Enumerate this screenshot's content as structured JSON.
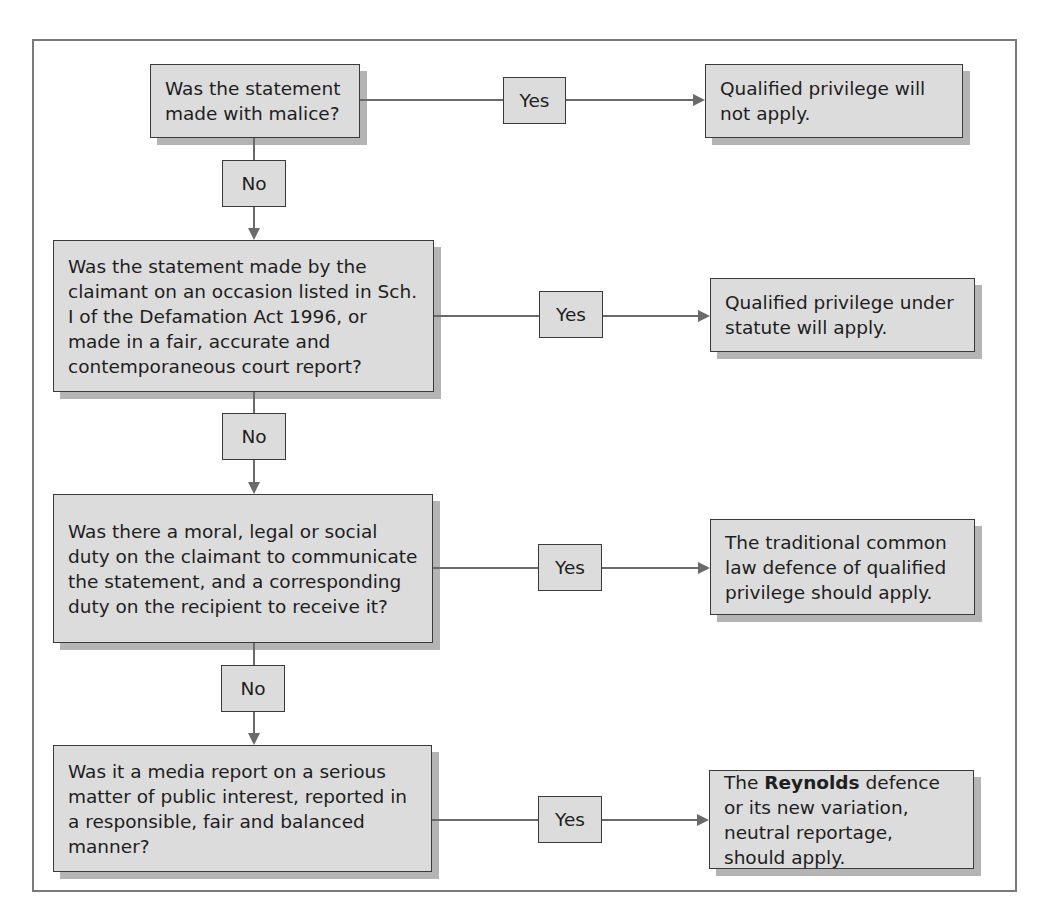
{
  "diagram": {
    "type": "flowchart",
    "questions": [
      {
        "id": "q1",
        "text": "Was the statement made with malice?"
      },
      {
        "id": "q2",
        "text": "Was the statement made by the claimant on an occasion listed in Sch. I of the Defamation Act 1996, or made in a fair, accurate and contemporaneous court report?"
      },
      {
        "id": "q3",
        "text": "Was there a moral, legal or social duty on the claimant to communicate the statement, and a corresponding duty on the recipient to receive it?"
      },
      {
        "id": "q4",
        "text": "Was it a media report on a serious matter of public interest, reported in a responsible, fair and balanced manner?"
      }
    ],
    "outcomes": [
      {
        "id": "o1",
        "text": "Qualified privilege will not apply."
      },
      {
        "id": "o2",
        "text": "Qualified privilege under statute will apply."
      },
      {
        "id": "o3",
        "text": "The traditional common law defence of qualified privilege should apply."
      },
      {
        "id": "o4",
        "prefix": "The ",
        "bold": "Reynolds",
        "suffix": " defence or its new variation, neutral reportage, should apply."
      }
    ],
    "edge_labels": {
      "yes": "Yes",
      "no": "No"
    },
    "edges": [
      {
        "from": "q1",
        "to": "o1",
        "label": "Yes"
      },
      {
        "from": "q1",
        "to": "q2",
        "label": "No"
      },
      {
        "from": "q2",
        "to": "o2",
        "label": "Yes"
      },
      {
        "from": "q2",
        "to": "q3",
        "label": "No"
      },
      {
        "from": "q3",
        "to": "o3",
        "label": "Yes"
      },
      {
        "from": "q3",
        "to": "q4",
        "label": "No"
      },
      {
        "from": "q4",
        "to": "o4",
        "label": "Yes"
      }
    ]
  }
}
